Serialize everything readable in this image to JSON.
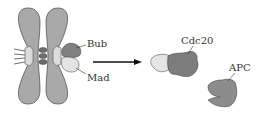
{
  "diagram": {
    "labels": {
      "bub": "Bub",
      "mad": "Mad",
      "cdc20": "Cdc20",
      "apc": "APC"
    },
    "colors": {
      "chromosome": "#a9a9a9",
      "chromosome_stroke": "#555555",
      "kinetochore": "#dcdcdc",
      "cohesin": "#6e6e6e",
      "bub": "#808080",
      "mad": "#e4e4e4",
      "cdc20": "#7d7d7d",
      "apc": "#8c8c8c",
      "arrow": "#111111",
      "label_text": "#333333"
    }
  }
}
